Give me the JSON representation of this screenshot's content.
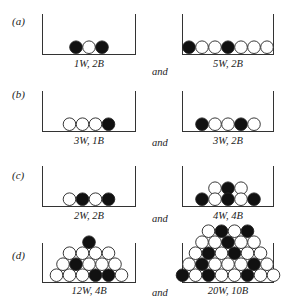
{
  "figure": {
    "rows": [
      {
        "label": "(a)",
        "connector": "and",
        "left": {
          "caption": "1W, 2B",
          "balls": [
            [
              "B",
              "W",
              "B"
            ]
          ]
        },
        "right": {
          "caption": "5W, 2B",
          "balls": [
            [
              "B",
              "W",
              "W",
              "B",
              "W",
              "W",
              "W"
            ]
          ]
        }
      },
      {
        "label": "(b)",
        "connector": "and",
        "left": {
          "caption": "3W, 1B",
          "balls": [
            [
              "W",
              "W",
              "W",
              "B"
            ]
          ]
        },
        "right": {
          "caption": "3W, 2B",
          "balls": [
            [
              "B",
              "W",
              "W",
              "B",
              "W"
            ]
          ]
        }
      },
      {
        "label": "(c)",
        "connector": "and",
        "left": {
          "caption": "2W, 2B",
          "balls": [
            [
              "W",
              "B",
              "W",
              "B"
            ]
          ]
        },
        "right": {
          "caption": "4W, 4B",
          "balls": [
            [
              "W",
              "B",
              "W"
            ],
            [
              "B",
              "W",
              "B",
              "W",
              "B"
            ]
          ]
        }
      },
      {
        "label": "(d)",
        "connector": "and",
        "left": {
          "caption": "12W, 4B",
          "balls": [
            [
              "B"
            ],
            [
              "W",
              "W",
              "W",
              "W"
            ],
            [
              "W",
              "B",
              "W",
              "W",
              "W"
            ],
            [
              "W",
              "W",
              "W",
              "B",
              "B",
              "W"
            ]
          ]
        },
        "right": {
          "caption": "20W, 10B",
          "balls": [
            [
              "W",
              "B",
              "W",
              "B"
            ],
            [
              "W",
              "W",
              "B",
              "W",
              "W"
            ],
            [
              "W",
              "B",
              "W",
              "B",
              "W",
              "W"
            ],
            [
              "W",
              "B",
              "W",
              "W",
              "W",
              "B",
              "W"
            ],
            [
              "B",
              "W",
              "B",
              "W",
              "W",
              "B",
              "W",
              "W"
            ]
          ]
        }
      }
    ],
    "colors": {
      "black_ball": "#111111",
      "white_ball": "#ffffff",
      "outline": "#222222"
    }
  }
}
